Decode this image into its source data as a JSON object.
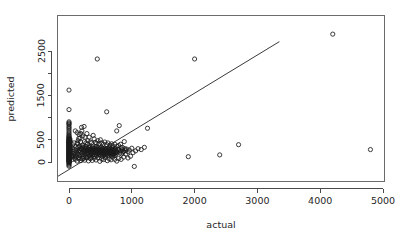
{
  "figure": {
    "background_color": "#ffffff",
    "foreground_color": "#1a1a1a",
    "width": 401,
    "height": 243
  },
  "chart_data": {
    "type": "scatter",
    "title": "",
    "subtitle": "",
    "xlabel": "actual",
    "ylabel": "predicted",
    "xlim": [
      -250,
      5050
    ],
    "ylim": [
      -300,
      3000
    ],
    "xticks": [
      0,
      1000,
      2000,
      3000,
      4000,
      5000
    ],
    "xtick_labels": [
      "0",
      "1000",
      "2000",
      "3000",
      "4000",
      "5000"
    ],
    "yticks": [
      0,
      500,
      1500,
      2500
    ],
    "ytick_labels": [
      "0",
      "500",
      "1500",
      "2500"
    ],
    "yminor_ticks": [
      1000,
      2000
    ],
    "grid": false,
    "legend": null,
    "point_marker": "open-circle",
    "point_radius_px": 2.1,
    "annotations": [],
    "reference_line": {
      "type": "linear-fit",
      "label": "",
      "slope": 0.86,
      "intercept": -170,
      "x_start": -250,
      "x_end": 3350
    },
    "points": [
      [
        0,
        1620
      ],
      [
        0,
        1180
      ],
      [
        0,
        905
      ],
      [
        0,
        880
      ],
      [
        0,
        860
      ],
      [
        0,
        840
      ],
      [
        0,
        800
      ],
      [
        0,
        770
      ],
      [
        0,
        740
      ],
      [
        0,
        700
      ],
      [
        0,
        660
      ],
      [
        0,
        630
      ],
      [
        0,
        600
      ],
      [
        0,
        580
      ],
      [
        0,
        560
      ],
      [
        0,
        545
      ],
      [
        0,
        530
      ],
      [
        0,
        515
      ],
      [
        0,
        500
      ],
      [
        0,
        490
      ],
      [
        0,
        480
      ],
      [
        0,
        470
      ],
      [
        0,
        460
      ],
      [
        0,
        450
      ],
      [
        0,
        440
      ],
      [
        0,
        430
      ],
      [
        0,
        420
      ],
      [
        0,
        410
      ],
      [
        0,
        400
      ],
      [
        0,
        390
      ],
      [
        0,
        380
      ],
      [
        0,
        370
      ],
      [
        0,
        360
      ],
      [
        0,
        350
      ],
      [
        0,
        340
      ],
      [
        0,
        330
      ],
      [
        0,
        320
      ],
      [
        0,
        310
      ],
      [
        0,
        300
      ],
      [
        0,
        290
      ],
      [
        0,
        280
      ],
      [
        0,
        270
      ],
      [
        0,
        260
      ],
      [
        0,
        250
      ],
      [
        0,
        240
      ],
      [
        0,
        230
      ],
      [
        0,
        220
      ],
      [
        0,
        210
      ],
      [
        0,
        200
      ],
      [
        0,
        195
      ],
      [
        0,
        185
      ],
      [
        0,
        175
      ],
      [
        0,
        165
      ],
      [
        0,
        155
      ],
      [
        0,
        145
      ],
      [
        0,
        135
      ],
      [
        0,
        125
      ],
      [
        0,
        115
      ],
      [
        0,
        105
      ],
      [
        0,
        95
      ],
      [
        0,
        85
      ],
      [
        0,
        75
      ],
      [
        0,
        65
      ],
      [
        0,
        55
      ],
      [
        0,
        45
      ],
      [
        0,
        35
      ],
      [
        0,
        25
      ],
      [
        0,
        15
      ],
      [
        0,
        5
      ],
      [
        0,
        -10
      ],
      [
        0,
        -25
      ],
      [
        0,
        -45
      ],
      [
        0,
        -70
      ],
      [
        0,
        -95
      ],
      [
        15,
        520
      ],
      [
        20,
        470
      ],
      [
        25,
        350
      ],
      [
        30,
        260
      ],
      [
        35,
        200
      ],
      [
        40,
        150
      ],
      [
        45,
        110
      ],
      [
        50,
        320
      ],
      [
        55,
        390
      ],
      [
        60,
        60
      ],
      [
        65,
        240
      ],
      [
        70,
        180
      ],
      [
        75,
        130
      ],
      [
        80,
        430
      ],
      [
        85,
        280
      ],
      [
        90,
        90
      ],
      [
        95,
        210
      ],
      [
        100,
        700
      ],
      [
        105,
        160
      ],
      [
        110,
        340
      ],
      [
        115,
        250
      ],
      [
        120,
        120
      ],
      [
        125,
        300
      ],
      [
        130,
        660
      ],
      [
        135,
        190
      ],
      [
        140,
        410
      ],
      [
        145,
        230
      ],
      [
        150,
        170
      ],
      [
        155,
        530
      ],
      [
        160,
        100
      ],
      [
        165,
        270
      ],
      [
        170,
        360
      ],
      [
        175,
        140
      ],
      [
        180,
        220
      ],
      [
        185,
        450
      ],
      [
        190,
        310
      ],
      [
        195,
        80
      ],
      [
        200,
        780
      ],
      [
        205,
        200
      ],
      [
        210,
        290
      ],
      [
        215,
        380
      ],
      [
        220,
        160
      ],
      [
        225,
        240
      ],
      [
        230,
        120
      ],
      [
        235,
        330
      ],
      [
        240,
        210
      ],
      [
        245,
        460
      ],
      [
        250,
        180
      ],
      [
        255,
        270
      ],
      [
        260,
        140
      ],
      [
        265,
        350
      ],
      [
        270,
        230
      ],
      [
        275,
        190
      ],
      [
        280,
        300
      ],
      [
        285,
        110
      ],
      [
        290,
        250
      ],
      [
        295,
        400
      ],
      [
        300,
        170
      ],
      [
        305,
        260
      ],
      [
        310,
        200
      ],
      [
        315,
        320
      ],
      [
        320,
        130
      ],
      [
        325,
        280
      ],
      [
        330,
        220
      ],
      [
        335,
        360
      ],
      [
        340,
        150
      ],
      [
        345,
        240
      ],
      [
        350,
        190
      ],
      [
        355,
        300
      ],
      [
        360,
        100
      ],
      [
        365,
        270
      ],
      [
        370,
        210
      ],
      [
        375,
        340
      ],
      [
        380,
        160
      ],
      [
        385,
        250
      ],
      [
        390,
        180
      ],
      [
        395,
        290
      ],
      [
        400,
        220
      ],
      [
        405,
        130
      ],
      [
        410,
        310
      ],
      [
        415,
        200
      ],
      [
        420,
        260
      ],
      [
        425,
        170
      ],
      [
        430,
        350
      ],
      [
        435,
        230
      ],
      [
        440,
        140
      ],
      [
        445,
        280
      ],
      [
        450,
        2320
      ],
      [
        455,
        190
      ],
      [
        460,
        240
      ],
      [
        465,
        320
      ],
      [
        470,
        160
      ],
      [
        475,
        270
      ],
      [
        480,
        210
      ],
      [
        485,
        180
      ],
      [
        490,
        300
      ],
      [
        495,
        230
      ],
      [
        500,
        150
      ],
      [
        505,
        260
      ],
      [
        510,
        200
      ],
      [
        515,
        330
      ],
      [
        520,
        175
      ],
      [
        525,
        240
      ],
      [
        530,
        290
      ],
      [
        535,
        120
      ],
      [
        540,
        220
      ],
      [
        545,
        195
      ],
      [
        550,
        270
      ],
      [
        555,
        160
      ],
      [
        560,
        310
      ],
      [
        565,
        230
      ],
      [
        570,
        185
      ],
      [
        575,
        250
      ],
      [
        580,
        140
      ],
      [
        585,
        280
      ],
      [
        590,
        205
      ],
      [
        595,
        165
      ],
      [
        600,
        1130
      ],
      [
        605,
        235
      ],
      [
        610,
        300
      ],
      [
        615,
        180
      ],
      [
        620,
        255
      ],
      [
        625,
        210
      ],
      [
        630,
        150
      ],
      [
        635,
        275
      ],
      [
        640,
        225
      ],
      [
        645,
        320
      ],
      [
        650,
        190
      ],
      [
        655,
        245
      ],
      [
        660,
        170
      ],
      [
        665,
        290
      ],
      [
        670,
        215
      ],
      [
        675,
        135
      ],
      [
        680,
        260
      ],
      [
        685,
        200
      ],
      [
        690,
        310
      ],
      [
        695,
        175
      ],
      [
        700,
        240
      ],
      [
        705,
        280
      ],
      [
        710,
        160
      ],
      [
        715,
        225
      ],
      [
        720,
        195
      ],
      [
        725,
        265
      ],
      [
        730,
        145
      ],
      [
        735,
        300
      ],
      [
        740,
        210
      ],
      [
        745,
        250
      ],
      [
        750,
        180
      ],
      [
        760,
        700
      ],
      [
        770,
        230
      ],
      [
        780,
        290
      ],
      [
        790,
        270
      ],
      [
        800,
        820
      ],
      [
        810,
        200
      ],
      [
        820,
        250
      ],
      [
        830,
        320
      ],
      [
        840,
        180
      ],
      [
        850,
        280
      ],
      [
        860,
        220
      ],
      [
        870,
        240
      ],
      [
        880,
        460
      ],
      [
        890,
        300
      ],
      [
        900,
        260
      ],
      [
        920,
        290
      ],
      [
        940,
        230
      ],
      [
        960,
        270
      ],
      [
        980,
        130
      ],
      [
        1000,
        310
      ],
      [
        1020,
        210
      ],
      [
        1040,
        -100
      ],
      [
        1060,
        250
      ],
      [
        1100,
        300
      ],
      [
        1150,
        280
      ],
      [
        1200,
        330
      ],
      [
        1250,
        760
      ],
      [
        1900,
        120
      ],
      [
        2000,
        2320
      ],
      [
        2400,
        160
      ],
      [
        2700,
        390
      ],
      [
        4200,
        2880
      ],
      [
        4800,
        280
      ],
      [
        5,
        500
      ],
      [
        5,
        475
      ],
      [
        5,
        455
      ],
      [
        5,
        435
      ],
      [
        5,
        415
      ],
      [
        5,
        395
      ],
      [
        5,
        375
      ],
      [
        5,
        355
      ],
      [
        5,
        335
      ],
      [
        5,
        315
      ],
      [
        5,
        295
      ],
      [
        5,
        275
      ],
      [
        5,
        255
      ],
      [
        5,
        235
      ],
      [
        5,
        215
      ],
      [
        5,
        190
      ],
      [
        5,
        170
      ],
      [
        5,
        150
      ],
      [
        5,
        130
      ],
      [
        5,
        110
      ],
      [
        5,
        90
      ],
      [
        5,
        70
      ],
      [
        5,
        50
      ],
      [
        5,
        30
      ],
      [
        10,
        490
      ],
      [
        10,
        445
      ],
      [
        10,
        405
      ],
      [
        10,
        365
      ],
      [
        10,
        325
      ],
      [
        10,
        285
      ],
      [
        10,
        245
      ],
      [
        10,
        205
      ],
      [
        10,
        165
      ],
      [
        10,
        125
      ],
      [
        10,
        85
      ],
      [
        10,
        45
      ],
      [
        10,
        5
      ],
      [
        130,
        430
      ],
      [
        145,
        480
      ],
      [
        160,
        620
      ],
      [
        175,
        540
      ],
      [
        190,
        640
      ],
      [
        205,
        700
      ],
      [
        220,
        590
      ],
      [
        240,
        800
      ],
      [
        255,
        560
      ],
      [
        270,
        430
      ],
      [
        285,
        640
      ],
      [
        300,
        480
      ],
      [
        320,
        560
      ],
      [
        340,
        450
      ],
      [
        360,
        430
      ],
      [
        385,
        600
      ],
      [
        400,
        520
      ],
      [
        420,
        440
      ],
      [
        440,
        420
      ],
      [
        460,
        480
      ],
      [
        480,
        410
      ],
      [
        500,
        500
      ],
      [
        520,
        430
      ],
      [
        545,
        400
      ],
      [
        570,
        450
      ],
      [
        600,
        390
      ],
      [
        620,
        430
      ],
      [
        650,
        380
      ],
      [
        680,
        410
      ],
      [
        700,
        360
      ],
      [
        730,
        400
      ],
      [
        760,
        350
      ],
      [
        790,
        370
      ],
      [
        820,
        400
      ],
      [
        850,
        330
      ],
      [
        150,
        330
      ],
      [
        170,
        260
      ],
      [
        195,
        300
      ],
      [
        215,
        340
      ],
      [
        235,
        270
      ],
      [
        260,
        310
      ],
      [
        280,
        250
      ],
      [
        305,
        290
      ],
      [
        325,
        330
      ],
      [
        350,
        260
      ],
      [
        370,
        300
      ],
      [
        395,
        240
      ],
      [
        415,
        280
      ],
      [
        435,
        320
      ],
      [
        455,
        250
      ],
      [
        475,
        290
      ],
      [
        495,
        230
      ],
      [
        515,
        270
      ],
      [
        535,
        310
      ],
      [
        555,
        240
      ],
      [
        575,
        280
      ],
      [
        595,
        220
      ],
      [
        615,
        260
      ],
      [
        635,
        300
      ],
      [
        655,
        230
      ],
      [
        675,
        270
      ],
      [
        695,
        210
      ],
      [
        715,
        250
      ],
      [
        735,
        290
      ],
      [
        755,
        220
      ],
      [
        100,
        60
      ],
      [
        130,
        20
      ],
      [
        160,
        70
      ],
      [
        190,
        30
      ],
      [
        220,
        80
      ],
      [
        250,
        40
      ],
      [
        280,
        90
      ],
      [
        310,
        25
      ],
      [
        340,
        75
      ],
      [
        370,
        35
      ],
      [
        400,
        85
      ],
      [
        430,
        45
      ],
      [
        460,
        95
      ],
      [
        490,
        15
      ],
      [
        520,
        65
      ],
      [
        550,
        55
      ],
      [
        580,
        100
      ],
      [
        610,
        30
      ],
      [
        640,
        70
      ],
      [
        670,
        50
      ],
      [
        700,
        110
      ],
      [
        730,
        60
      ],
      [
        760,
        20
      ],
      [
        790,
        80
      ],
      [
        830,
        60
      ],
      [
        870,
        110
      ],
      [
        905,
        180
      ],
      [
        940,
        90
      ]
    ]
  },
  "axes": {
    "x_axis_title": "actual",
    "y_axis_title": "predicted"
  }
}
